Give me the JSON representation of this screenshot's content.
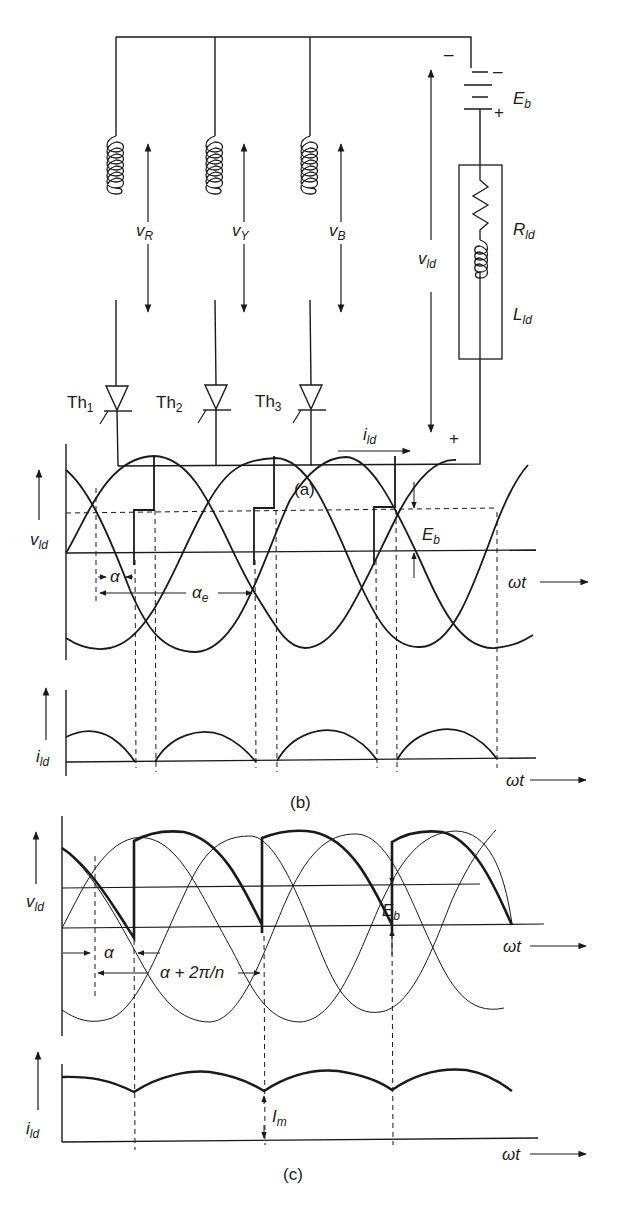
{
  "figure": {
    "panels": [
      {
        "id": "a",
        "caption": "(a)",
        "type": "circuit"
      },
      {
        "id": "b",
        "caption": "(b)",
        "type": "waveform"
      },
      {
        "id": "c",
        "caption": "(c)",
        "type": "waveform"
      }
    ]
  },
  "circuit": {
    "phases": [
      {
        "label": "v",
        "sub": "R"
      },
      {
        "label": "v",
        "sub": "Y"
      },
      {
        "label": "v",
        "sub": "B"
      }
    ],
    "thyristors": [
      {
        "label": "Th",
        "sub": "1"
      },
      {
        "label": "Th",
        "sub": "2"
      },
      {
        "label": "Th",
        "sub": "3"
      }
    ],
    "battery": {
      "label": "E",
      "sub": "b",
      "neg": "–",
      "pos": "+"
    },
    "resistor": {
      "label": "R",
      "sub": "ld"
    },
    "inductor": {
      "label": "L",
      "sub": "ld"
    },
    "load_voltage": {
      "label": "v",
      "sub": "ld",
      "neg": "–",
      "pos": "+"
    },
    "load_current": {
      "label": "i",
      "sub": "ld"
    }
  },
  "panel_b": {
    "y_top_label": {
      "label": "v",
      "sub": "ld"
    },
    "y_bottom_label": {
      "label": "i",
      "sub": "ld"
    },
    "alpha": "α",
    "alpha_e": {
      "label": "α",
      "sub": "e"
    },
    "eb": {
      "label": "E",
      "sub": "b"
    },
    "x_label": "ωt"
  },
  "panel_c": {
    "y_top_label": {
      "label": "v",
      "sub": "ld"
    },
    "y_bottom_label": {
      "label": "i",
      "sub": "ld"
    },
    "alpha": "α",
    "alpha_2pi": "α + 2π/n",
    "eb": {
      "label": "E",
      "sub": "b"
    },
    "im": {
      "label": "I",
      "sub": "m"
    },
    "x_label": "ωt"
  }
}
